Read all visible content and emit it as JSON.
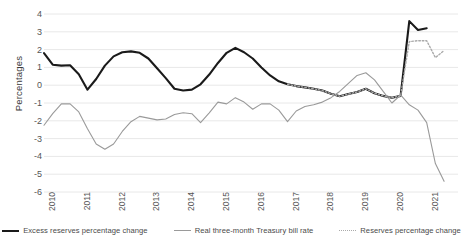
{
  "chart_data": {
    "type": "line",
    "title": "",
    "xlabel": "",
    "ylabel": "Percentages",
    "ylim": [
      -6,
      4
    ],
    "yticks": [
      4,
      3,
      2,
      1,
      0,
      -1,
      -2,
      -3,
      -4,
      -5,
      -6
    ],
    "ytick_labels": [
      "4",
      "3",
      "2",
      "1",
      "0",
      "-1",
      "-2",
      "-3",
      "-4",
      "-5",
      "-6"
    ],
    "xlim": [
      2010,
      2021.9
    ],
    "xticks": [
      2010,
      2011,
      2012,
      2013,
      2014,
      2015,
      2016,
      2017,
      2018,
      2019,
      2020,
      2021
    ],
    "xtick_labels": [
      "2010",
      "2011",
      "2012",
      "2013",
      "2014",
      "2015",
      "2016",
      "2017",
      "2018",
      "2019",
      "2020",
      "2021"
    ],
    "grid": true,
    "grid_axis": "y",
    "legend_position": "bottom",
    "series": [
      {
        "name": "Excess reserves percentage change",
        "style": "solid",
        "color": "#1a1a1a",
        "width": 2.1,
        "x": [
          2010.0,
          2010.25,
          2010.5,
          2010.75,
          2011.0,
          2011.25,
          2011.5,
          2011.75,
          2012.0,
          2012.25,
          2012.5,
          2012.75,
          2013.0,
          2013.25,
          2013.5,
          2013.75,
          2014.0,
          2014.25,
          2014.5,
          2014.75,
          2015.0,
          2015.25,
          2015.5,
          2015.75,
          2016.0,
          2016.25,
          2016.5,
          2016.75,
          2017.0,
          2017.25,
          2017.5,
          2017.75,
          2018.0,
          2018.25,
          2018.5,
          2018.75,
          2019.0,
          2019.25,
          2019.5,
          2019.75,
          2020.0,
          2020.25,
          2020.5,
          2020.75,
          2021.0
        ],
        "values": [
          1.8,
          1.15,
          1.1,
          1.12,
          0.62,
          -0.25,
          0.35,
          1.1,
          1.62,
          1.85,
          1.9,
          1.82,
          1.5,
          0.95,
          0.4,
          -0.2,
          -0.3,
          -0.25,
          0.05,
          0.6,
          1.25,
          1.82,
          2.1,
          1.85,
          1.5,
          1.0,
          0.55,
          0.22,
          0.05,
          -0.05,
          -0.12,
          -0.2,
          -0.3,
          -0.48,
          -0.62,
          -0.5,
          -0.38,
          -0.2,
          -0.45,
          -0.6,
          -0.7,
          -0.6,
          3.6,
          3.1,
          3.2
        ]
      },
      {
        "name": "Real three-month Treasury bill rate",
        "style": "solid",
        "color": "#9a9a9a",
        "width": 1.1,
        "x": [
          2010.0,
          2010.25,
          2010.5,
          2010.75,
          2011.0,
          2011.25,
          2011.5,
          2011.75,
          2012.0,
          2012.25,
          2012.5,
          2012.75,
          2013.0,
          2013.25,
          2013.5,
          2013.75,
          2014.0,
          2014.25,
          2014.5,
          2014.75,
          2015.0,
          2015.25,
          2015.5,
          2015.75,
          2016.0,
          2016.25,
          2016.5,
          2016.75,
          2017.0,
          2017.25,
          2017.5,
          2017.75,
          2018.0,
          2018.25,
          2018.5,
          2018.75,
          2019.0,
          2019.25,
          2019.5,
          2019.75,
          2020.0,
          2020.25,
          2020.5,
          2020.75,
          2021.0,
          2021.25,
          2021.5
        ],
        "values": [
          -2.25,
          -1.6,
          -1.05,
          -1.05,
          -1.5,
          -2.45,
          -3.3,
          -3.6,
          -3.3,
          -2.6,
          -2.05,
          -1.75,
          -1.85,
          -1.95,
          -1.9,
          -1.65,
          -1.55,
          -1.6,
          -2.1,
          -1.55,
          -0.95,
          -1.05,
          -0.7,
          -0.95,
          -1.35,
          -1.05,
          -1.05,
          -1.4,
          -2.05,
          -1.45,
          -1.2,
          -1.1,
          -0.95,
          -0.7,
          -0.35,
          0.1,
          0.55,
          0.7,
          0.3,
          -0.35,
          -1.0,
          -0.55,
          -1.1,
          -1.4,
          -2.1,
          -4.4,
          -5.4
        ]
      },
      {
        "name": "Reserves percentage change",
        "style": "dotted",
        "color": "#aaaaaa",
        "width": 1.4,
        "x": [
          2017.0,
          2017.25,
          2017.5,
          2017.75,
          2018.0,
          2018.25,
          2018.5,
          2018.75,
          2019.0,
          2019.25,
          2019.5,
          2019.75,
          2020.0,
          2020.25,
          2020.5,
          2020.75,
          2021.0,
          2021.25,
          2021.5
        ],
        "values": [
          0.05,
          -0.05,
          -0.12,
          -0.2,
          -0.3,
          -0.48,
          -0.62,
          -0.5,
          -0.38,
          -0.2,
          -0.45,
          -0.6,
          -0.7,
          -0.6,
          2.45,
          2.5,
          2.5,
          1.55,
          1.95
        ]
      }
    ]
  },
  "legend": {
    "items": [
      {
        "label": "Excess reserves percentage change",
        "swatch": "line-solid-black-icon"
      },
      {
        "label": "Real three-month Treasury bill rate",
        "swatch": "line-solid-gray-icon"
      },
      {
        "label": "Reserves percentage change",
        "swatch": "line-dotted-gray-icon"
      }
    ]
  },
  "colors": {
    "excess_reserves": "#1a1a1a",
    "tbill": "#9a9a9a",
    "reserves": "#aaaaaa",
    "gridline": "#e8e8e8",
    "text": "#555555",
    "background": "#ffffff"
  }
}
